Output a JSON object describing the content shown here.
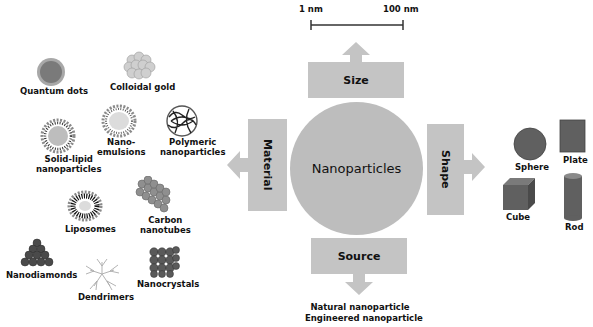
{
  "title": "Nanoparticles",
  "scale_bar": {
    "min_label": "1 nm",
    "max_label": "100 nm"
  },
  "categories": {
    "size": {
      "label": "Size"
    },
    "material": {
      "label": "Material"
    },
    "shape": {
      "label": "Shape"
    },
    "source": {
      "label": "Source"
    }
  },
  "materials": [
    {
      "label": "Quantum dots",
      "icon": "quantum-dot-icon"
    },
    {
      "label": "Colloidal gold",
      "icon": "colloidal-gold-icon"
    },
    {
      "label": "Solid-lipid nanoparticles",
      "line1": "Solid-lipid",
      "line2": "nanoparticles",
      "icon": "solid-lipid-icon"
    },
    {
      "label": "Nano-emulsions",
      "line1": "Nano-",
      "line2": "emulsions",
      "icon": "nanoemulsion-icon"
    },
    {
      "label": "Polymeric nanoparticles",
      "line1": "Polymeric",
      "line2": "nanoparticles",
      "icon": "polymeric-icon"
    },
    {
      "label": "Liposomes",
      "icon": "liposome-icon"
    },
    {
      "label": "Carbon nanotubes",
      "line1": "Carbon",
      "line2": "nanotubes",
      "icon": "carbon-nanotube-icon"
    },
    {
      "label": "Nanodiamonds",
      "icon": "nanodiamond-icon"
    },
    {
      "label": "Dendrimers",
      "icon": "dendrimer-icon"
    },
    {
      "label": "Nanocrystals",
      "icon": "nanocrystal-icon"
    }
  ],
  "shapes": [
    {
      "label": "Sphere"
    },
    {
      "label": "Plate"
    },
    {
      "label": "Cube"
    },
    {
      "label": "Rod"
    }
  ],
  "sources": [
    {
      "label": "Natural nanoparticle"
    },
    {
      "label": "Engineered nanoparticle"
    }
  ],
  "colors": {
    "box": "#c4c4c4",
    "circle": "#bdbdbd",
    "shape_fill": "#606060"
  }
}
